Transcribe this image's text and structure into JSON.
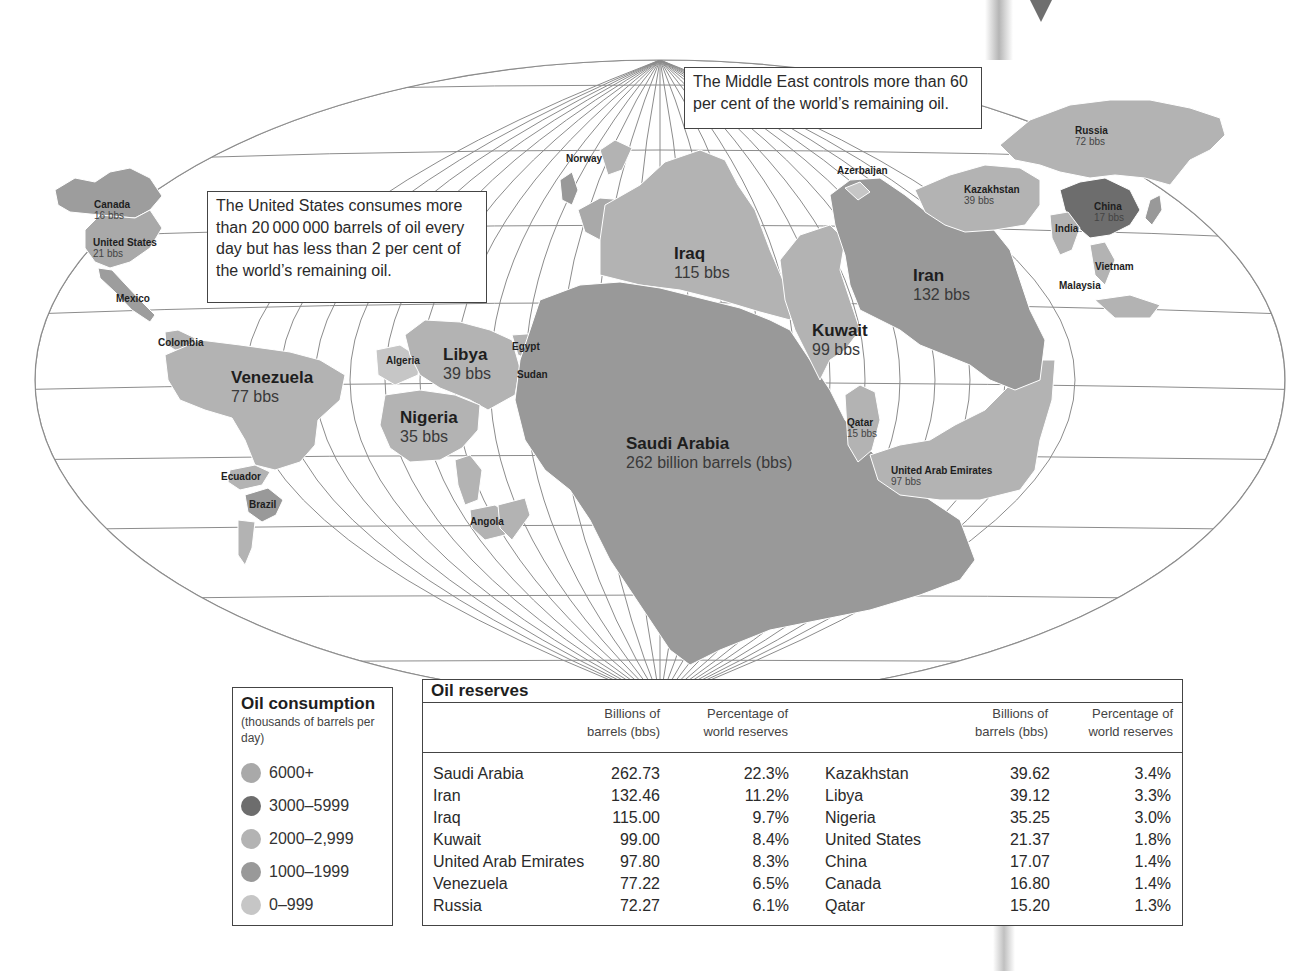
{
  "callouts": {
    "united_states": "The United States consumes more than 20 000 000 barrels of oil every day but has less than 2 per cent of the world’s remaining oil.",
    "middle_east": "The Middle East controls more than 60 per cent of the world’s remaining oil."
  },
  "map_labels": {
    "canada": {
      "name": "Canada",
      "value": "16 bbs"
    },
    "united_states": {
      "name": "United States",
      "value": "21 bbs"
    },
    "mexico": {
      "name": "Mexico"
    },
    "colombia": {
      "name": "Colombia"
    },
    "venezuela": {
      "name": "Venezuela",
      "value": "77 bbs"
    },
    "ecuador": {
      "name": "Ecuador"
    },
    "brazil": {
      "name": "Brazil"
    },
    "norway": {
      "name": "Norway"
    },
    "algeria": {
      "name": "Algeria"
    },
    "libya": {
      "name": "Libya",
      "value": "39 bbs"
    },
    "egypt": {
      "name": "Egypt"
    },
    "sudan": {
      "name": "Sudan"
    },
    "nigeria": {
      "name": "Nigeria",
      "value": "35 bbs"
    },
    "angola": {
      "name": "Angola"
    },
    "iraq": {
      "name": "Iraq",
      "value": "115 bbs"
    },
    "saudi_arabia": {
      "name": "Saudi Arabia",
      "value": "262 billion barrels (bbs)"
    },
    "kuwait": {
      "name": "Kuwait",
      "value": "99 bbs"
    },
    "qatar": {
      "name": "Qatar",
      "value": "15 bbs"
    },
    "uae": {
      "name": "United Arab Emirates",
      "value": "97 bbs"
    },
    "iran": {
      "name": "Iran",
      "value": "132 bbs"
    },
    "azerbaijan": {
      "name": "Azerbaijan"
    },
    "kazakhstan": {
      "name": "Kazakhstan",
      "value": "39 bbs"
    },
    "russia": {
      "name": "Russia",
      "value": "72 bbs"
    },
    "china": {
      "name": "China",
      "value": "17 bbs"
    },
    "india": {
      "name": "India"
    },
    "vietnam": {
      "name": "Vietnam"
    },
    "malaysia": {
      "name": "Malaysia"
    }
  },
  "legend": {
    "title": "Oil consumption",
    "subtitle": "(thousands of barrels per day)",
    "items": [
      {
        "label": "6000+",
        "color": "#a9a9a9"
      },
      {
        "label": "3000–5999",
        "color": "#6d6d6d"
      },
      {
        "label": "2000–2,999",
        "color": "#b3b3b3"
      },
      {
        "label": "1000–1999",
        "color": "#999999"
      },
      {
        "label": "0–999",
        "color": "#c6c6c6"
      }
    ]
  },
  "reserves": {
    "title": "Oil reserves",
    "col_barrels": "Billions of barrels (bbs)",
    "col_barrels_l1": "Billions of",
    "col_barrels_l2": "barrels (bbs)",
    "col_pct_l1": "Percentage of",
    "col_pct_l2": "world reserves",
    "left": [
      {
        "country": "Saudi Arabia",
        "barrels": "262.73",
        "pct": "22.3%"
      },
      {
        "country": "Iran",
        "barrels": "132.46",
        "pct": "11.2%"
      },
      {
        "country": "Iraq",
        "barrels": "115.00",
        "pct": "9.7%"
      },
      {
        "country": "Kuwait",
        "barrels": "99.00",
        "pct": "8.4%"
      },
      {
        "country": "United Arab Emirates",
        "barrels": "97.80",
        "pct": "8.3%"
      },
      {
        "country": "Venezuela",
        "barrels": "77.22",
        "pct": "6.5%"
      },
      {
        "country": "Russia",
        "barrels": "72.27",
        "pct": "6.1%"
      }
    ],
    "right": [
      {
        "country": "Kazakhstan",
        "barrels": "39.62",
        "pct": "3.4%"
      },
      {
        "country": "Libya",
        "barrels": "39.12",
        "pct": "3.3%"
      },
      {
        "country": "Nigeria",
        "barrels": "35.25",
        "pct": "3.0%"
      },
      {
        "country": "United States",
        "barrels": "21.37",
        "pct": "1.8%"
      },
      {
        "country": "China",
        "barrels": "17.07",
        "pct": "1.4%"
      },
      {
        "country": "Canada",
        "barrels": "16.80",
        "pct": "1.4%"
      },
      {
        "country": "Qatar",
        "barrels": "15.20",
        "pct": "1.3%"
      }
    ]
  },
  "colors": {
    "tone_6000": "#a9a9a9",
    "tone_3000": "#6d6d6d",
    "tone_2000": "#b3b3b3",
    "tone_1000": "#999999",
    "tone_0": "#c6c6c6",
    "graticule": "#8a8a8a",
    "border": "#444444"
  }
}
